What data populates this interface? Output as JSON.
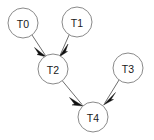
{
  "graph": {
    "type": "directed-acyclic-graph",
    "width": 154,
    "height": 140,
    "background_color": "#ffffff",
    "node_fill_color": "#ffffff",
    "node_stroke_color": "#8a8a8a",
    "label_color": "#1a1a1a",
    "edge_color": "#6f6f6f",
    "arrowhead_color": "#101010",
    "nodes": [
      {
        "id": "T0",
        "label": "T0",
        "cx": 23,
        "cy": 23,
        "r": 15
      },
      {
        "id": "T1",
        "label": "T1",
        "cx": 77,
        "cy": 22,
        "r": 15
      },
      {
        "id": "T2",
        "label": "T2",
        "cx": 53,
        "cy": 69,
        "r": 15
      },
      {
        "id": "T3",
        "label": "T3",
        "cx": 128,
        "cy": 68,
        "r": 15
      },
      {
        "id": "T4",
        "label": "T4",
        "cx": 93,
        "cy": 117,
        "r": 15
      }
    ],
    "edges": [
      {
        "from": "T0",
        "to": "T2",
        "x1": 32,
        "y1": 35,
        "x2": 45,
        "y2": 55
      },
      {
        "from": "T1",
        "to": "T2",
        "x1": 69,
        "y1": 34,
        "x2": 60,
        "y2": 55
      },
      {
        "from": "T2",
        "to": "T4",
        "x1": 62,
        "y1": 81,
        "x2": 82,
        "y2": 105
      },
      {
        "from": "T3",
        "to": "T4",
        "x1": 119,
        "y1": 80,
        "x2": 104,
        "y2": 104
      }
    ]
  }
}
